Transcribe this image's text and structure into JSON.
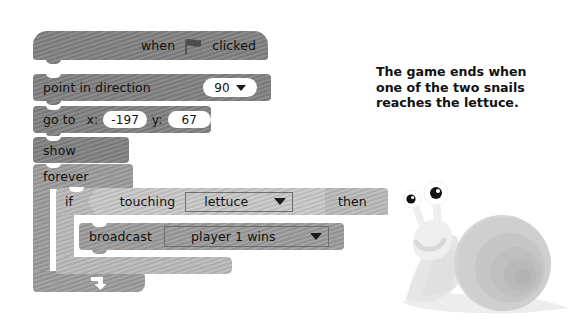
{
  "scratch_script": {
    "blocks": [
      {
        "id": "when-flag-clicked",
        "type": "hat",
        "words": [
          "when",
          "clicked"
        ],
        "icon": "green-flag-icon"
      },
      {
        "id": "point-in-direction",
        "type": "stack",
        "label": "point  in  direction",
        "field_value": "90",
        "field_type": "dropdown-oval"
      },
      {
        "id": "go-to-xy",
        "type": "stack",
        "label": "go to",
        "x_label": "x:",
        "x_value": "-197",
        "y_label": "y:",
        "y_value": "67"
      },
      {
        "id": "show",
        "type": "stack",
        "label": "show"
      },
      {
        "id": "forever",
        "type": "c-block",
        "label": "forever"
      },
      {
        "id": "if-then",
        "type": "c-block",
        "label_if": "if",
        "label_then": "then"
      },
      {
        "id": "touching",
        "type": "boolean",
        "label": "touching",
        "field_value": "lettuce"
      },
      {
        "id": "broadcast",
        "type": "stack",
        "label": "broadcast",
        "field_value": "player 1 wins"
      }
    ]
  },
  "caption": {
    "line1": "The game ends when",
    "line2": "one of the two snails",
    "line3": "reaches the lettuce."
  },
  "illustration": {
    "name": "snail-illustration",
    "alt": "grey cartoon snail"
  },
  "colors": {
    "block_dark": "#808080",
    "block_mid": "#9a9a9a",
    "block_light": "#b6b6b6",
    "block_lighter": "#c3c3c3",
    "text": "#111111",
    "field_white": "#ffffff",
    "page_background": "#ffffff"
  }
}
